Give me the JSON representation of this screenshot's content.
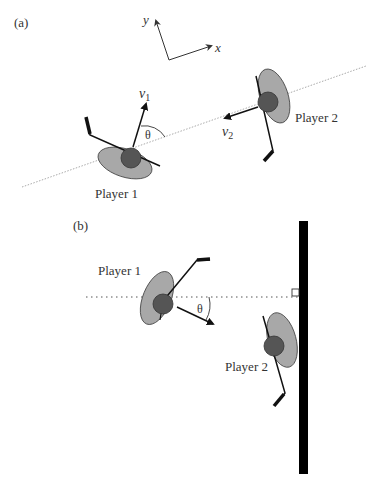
{
  "figure": {
    "colors": {
      "body": "#a8a8a8",
      "head": "#555555",
      "ink": "#111111",
      "dotted": "#aaaaaa",
      "wall": "#000000",
      "text": "#333333"
    },
    "panel_a": {
      "label": "(a)",
      "axes": {
        "x_label": "x",
        "y_label": "y"
      },
      "player1": {
        "label": "Player 1",
        "velocity_label": "v",
        "velocity_sub": "1"
      },
      "player2": {
        "label": "Player 2",
        "velocity_label": "v",
        "velocity_sub": "2"
      },
      "angle_label": "θ"
    },
    "panel_b": {
      "label": "(b)",
      "player1": {
        "label": "Player 1"
      },
      "player2": {
        "label": "Player 2"
      },
      "angle_label": "θ"
    }
  }
}
